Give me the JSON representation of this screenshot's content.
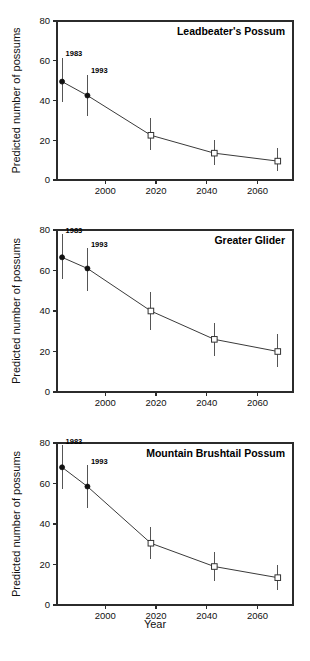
{
  "figure": {
    "shared_xlabel": "Year",
    "shared_ylabel": "Predicted number of possums",
    "panel_count": 3
  },
  "chart_data": [
    {
      "type": "line",
      "title": "Leadbeater's Possum",
      "xlabel": "Year",
      "ylabel": "Predicted number of possums",
      "xlim": [
        1981,
        2074
      ],
      "ylim": [
        0,
        80
      ],
      "xticks": [
        2000,
        2020,
        2040,
        2060
      ],
      "yticks": [
        0,
        20,
        40,
        60,
        80
      ],
      "grid": false,
      "legend": false,
      "x": [
        1983,
        1993,
        2018,
        2043,
        2068
      ],
      "values": [
        49.5,
        42.5,
        22.5,
        13.5,
        9.5
      ],
      "error_low": [
        39.0,
        32.0,
        15.0,
        7.5,
        4.5
      ],
      "error_high": [
        61.5,
        53.0,
        31.0,
        20.0,
        16.0
      ],
      "marker_styles": [
        "filled-circle",
        "filled-circle",
        "open-square",
        "open-square",
        "open-square"
      ],
      "annotations": [
        {
          "text": "1983",
          "x": 1983,
          "y": 61.5
        },
        {
          "text": "1993",
          "x": 1993,
          "y": 53.0
        }
      ]
    },
    {
      "type": "line",
      "title": "Greater Glider",
      "xlabel": "Year",
      "ylabel": "Predicted number of possums",
      "xlim": [
        1981,
        2074
      ],
      "ylim": [
        0,
        80
      ],
      "xticks": [
        2000,
        2020,
        2040,
        2060
      ],
      "yticks": [
        0,
        20,
        40,
        60,
        80
      ],
      "grid": false,
      "legend": false,
      "x": [
        1983,
        1993,
        2018,
        2043,
        2068
      ],
      "values": [
        66.5,
        61.0,
        40.0,
        26.0,
        20.0
      ],
      "error_low": [
        56.0,
        50.0,
        30.5,
        18.0,
        12.5
      ],
      "error_high": [
        78.0,
        71.0,
        49.5,
        34.0,
        28.5
      ],
      "marker_styles": [
        "filled-circle",
        "filled-circle",
        "open-square",
        "open-square",
        "open-square"
      ],
      "annotations": [
        {
          "text": "1983",
          "x": 1983,
          "y": 78.0
        },
        {
          "text": "1993",
          "x": 1993,
          "y": 71.0
        }
      ]
    },
    {
      "type": "line",
      "title": "Mountain Brushtail Possum",
      "xlabel": "Year",
      "ylabel": "Predicted number of possums",
      "xlim": [
        1981,
        2074
      ],
      "ylim": [
        0,
        80
      ],
      "xticks": [
        2000,
        2020,
        2040,
        2060
      ],
      "yticks": [
        0,
        20,
        40,
        60,
        80
      ],
      "grid": false,
      "legend": false,
      "x": [
        1983,
        1993,
        2018,
        2043,
        2068
      ],
      "values": [
        68.0,
        58.5,
        30.5,
        19.0,
        13.5
      ],
      "error_low": [
        57.5,
        48.0,
        22.5,
        12.0,
        7.5
      ],
      "error_high": [
        79.0,
        69.0,
        38.5,
        26.0,
        20.0
      ],
      "marker_styles": [
        "filled-circle",
        "filled-circle",
        "open-square",
        "open-square",
        "open-square"
      ],
      "annotations": [
        {
          "text": "1983",
          "x": 1983,
          "y": 79.0
        },
        {
          "text": "1993",
          "x": 1993,
          "y": 69.0
        }
      ]
    }
  ],
  "colors": {
    "axis": "#2b2b2b",
    "line": "#3a3a3a",
    "errorbar": "#555555",
    "marker_fill": "#111111",
    "marker_open_fill": "#ffffff",
    "background": "#ffffff",
    "text": "#111111"
  }
}
